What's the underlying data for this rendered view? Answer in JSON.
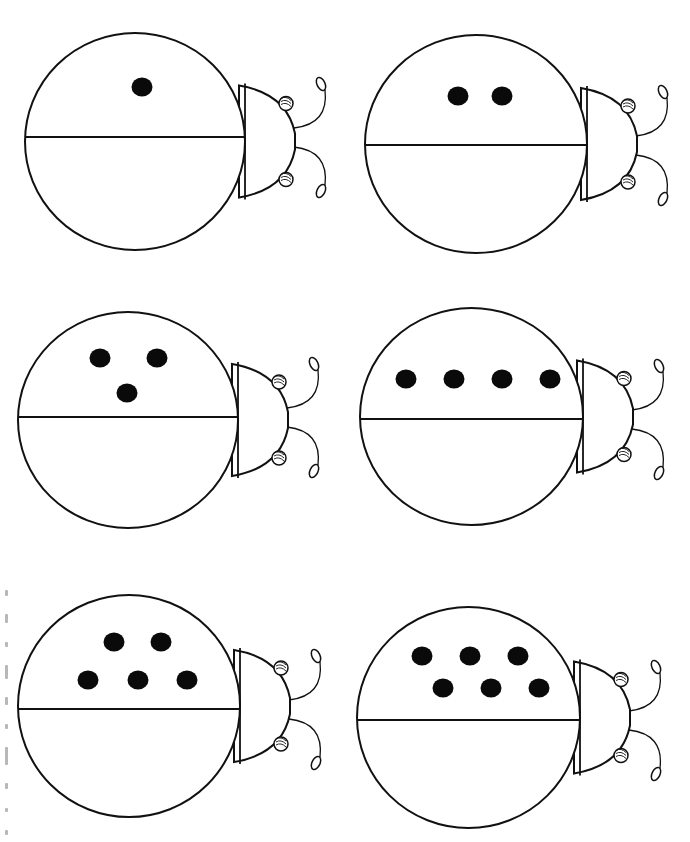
{
  "worksheet": {
    "type": "ladybug counting worksheet",
    "layout": {
      "columns": 2,
      "rows": 3
    },
    "colors": {
      "ink": "#111111",
      "dot": "#0a0a0a",
      "paper": "#ffffff"
    },
    "side_note": {
      "orientation": "vertical",
      "text_legible": false
    },
    "ladybugs": [
      {
        "id": 1,
        "dot_count": 1,
        "body": {
          "left": 25,
          "right": 245,
          "top": 33,
          "bottom": 250,
          "mid_y": 137
        },
        "head_right": 295,
        "dots": [
          [
            142,
            87
          ]
        ]
      },
      {
        "id": 2,
        "dot_count": 2,
        "body": {
          "left": 365,
          "right": 587,
          "top": 35,
          "bottom": 253,
          "mid_y": 145
        },
        "head_right": 637,
        "dots": [
          [
            458,
            96
          ],
          [
            502,
            96
          ]
        ]
      },
      {
        "id": 3,
        "dot_count": 3,
        "body": {
          "left": 18,
          "right": 238,
          "top": 312,
          "bottom": 528,
          "mid_y": 417
        },
        "head_right": 288,
        "dots": [
          [
            100,
            358
          ],
          [
            157,
            358
          ],
          [
            127,
            393
          ]
        ]
      },
      {
        "id": 4,
        "dot_count": 4,
        "body": {
          "left": 360,
          "right": 583,
          "top": 308,
          "bottom": 525,
          "mid_y": 419
        },
        "head_right": 633,
        "dots": [
          [
            406,
            379
          ],
          [
            454,
            379
          ],
          [
            502,
            379
          ],
          [
            550,
            379
          ]
        ]
      },
      {
        "id": 5,
        "dot_count": 5,
        "body": {
          "left": 18,
          "right": 240,
          "top": 595,
          "bottom": 817,
          "mid_y": 709
        },
        "head_right": 290,
        "dots": [
          [
            114,
            642
          ],
          [
            161,
            642
          ],
          [
            88,
            680
          ],
          [
            138,
            680
          ],
          [
            187,
            680
          ]
        ]
      },
      {
        "id": 6,
        "dot_count": 6,
        "body": {
          "left": 357,
          "right": 580,
          "top": 607,
          "bottom": 828,
          "mid_y": 720
        },
        "head_right": 630,
        "dots": [
          [
            422,
            656
          ],
          [
            470,
            656
          ],
          [
            518,
            656
          ],
          [
            443,
            688
          ],
          [
            491,
            688
          ],
          [
            539,
            688
          ]
        ]
      }
    ]
  }
}
